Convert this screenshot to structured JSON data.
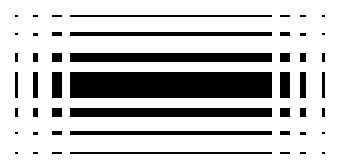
{
  "figure": {
    "type": "abstract-raster-pattern",
    "width": 349,
    "height": 168,
    "background_color": "#ffffff",
    "mark_color": "#000000",
    "row_count": 7,
    "column_count": 7,
    "symmetry": "horizontal and vertical mirror symmetry"
  },
  "rows": [
    {
      "index": 1,
      "y": 15,
      "height": 2
    },
    {
      "index": 2,
      "y": 32,
      "height": 4
    },
    {
      "index": 3,
      "y": 53,
      "height": 9
    },
    {
      "index": 4,
      "y": 72,
      "height": 26
    },
    {
      "index": 5,
      "y": 108,
      "height": 9
    },
    {
      "index": 6,
      "y": 131,
      "height": 4
    },
    {
      "index": 7,
      "y": 152,
      "height": 2
    }
  ],
  "columns": [
    {
      "index": 1,
      "x": 15,
      "width": 3
    },
    {
      "index": 2,
      "x": 33,
      "width": 5
    },
    {
      "index": 3,
      "x": 52,
      "width": 10
    },
    {
      "index": 4,
      "x": 70,
      "width": 202
    },
    {
      "index": 5,
      "x": 280,
      "width": 10
    },
    {
      "index": 6,
      "x": 300,
      "width": 6
    },
    {
      "index": 7,
      "x": 322,
      "width": 3
    }
  ],
  "column_scale": [
    0.55,
    0.75,
    1.0,
    1.0,
    1.0,
    0.75,
    0.55
  ],
  "row_scale": [
    1.0,
    1.0,
    1.0,
    1.0,
    1.0,
    1.0,
    1.0
  ]
}
